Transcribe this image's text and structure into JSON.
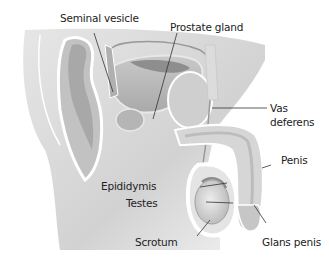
{
  "diagram": {
    "labels": {
      "seminal_vesicle": "Seminal vesicle",
      "prostate_gland": "Prostate gland",
      "vas_deferens_line1": "Vas",
      "vas_deferens_line2": "deferens",
      "penis": "Penis",
      "epididymis": "Epididymis",
      "testes": "Testes",
      "scrotum": "Scrotum",
      "glans_penis": "Glans penis"
    },
    "colors": {
      "background": "#ffffff",
      "body_gray": "#d9d9d9",
      "organ_gray": "#b8b8b8",
      "dark_gray": "#8a8a8a",
      "outline_white": "#ffffff",
      "leader_line": "#333333",
      "text": "#222222"
    }
  }
}
